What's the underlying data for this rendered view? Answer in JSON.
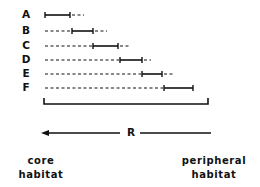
{
  "rows": [
    {
      "label": "A",
      "y": 15,
      "dash_from": 45,
      "solid_from": 45,
      "solid_to": 70,
      "dash_to": 84
    },
    {
      "label": "B",
      "y": 31,
      "dash_from": 45,
      "solid_from": 72,
      "solid_to": 93,
      "dash_to": 107
    },
    {
      "label": "C",
      "y": 46,
      "dash_from": 45,
      "solid_from": 93,
      "solid_to": 118,
      "dash_to": 129
    },
    {
      "label": "D",
      "y": 60,
      "dash_from": 45,
      "solid_from": 120,
      "solid_to": 142,
      "dash_to": 151
    },
    {
      "label": "E",
      "y": 74,
      "dash_from": 45,
      "solid_from": 142,
      "solid_to": 162,
      "dash_to": 174
    },
    {
      "label": "F",
      "y": 88,
      "dash_from": 45,
      "solid_from": 164,
      "solid_to": 193,
      "dash_to": 193
    }
  ],
  "bracket": {
    "x1": 44,
    "x2": 208,
    "y_top": 98,
    "y_bottom": 104
  },
  "gradient": {
    "label": "R",
    "direction": "toward core",
    "y": 133,
    "x_head": 41,
    "x_left_end": 120,
    "x_right_start": 140,
    "x_right_end": 211
  },
  "left_end_label": {
    "line1": "core",
    "line2": "habitat"
  },
  "right_end_label": {
    "line1": "peripheral",
    "line2": "habitat"
  },
  "colors": {
    "ink": "#111111",
    "background": "#ffffff"
  }
}
